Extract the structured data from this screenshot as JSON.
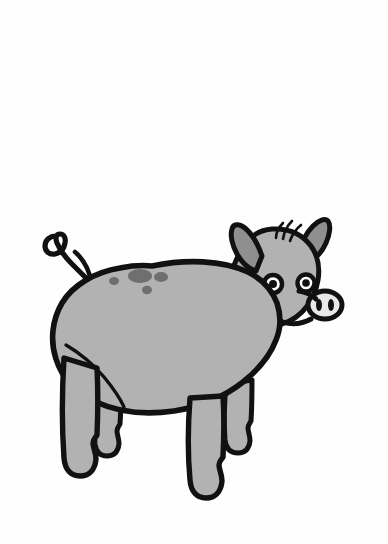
{
  "image": {
    "title": "Cartoon Pig",
    "subject": "pig",
    "style": "black-outline cartoon line drawing with flat gray fill",
    "orientation": "facing right, side profile (three-quarter head)",
    "width": 388,
    "height": 544
  },
  "colors": {
    "background": "#fefefe",
    "outline": "#111111",
    "body_fill": "#b2b2b2",
    "ear_inner_fill": "#8f8f8f",
    "spot_fill": "#6f6f6f",
    "eye_white": "#ffffff",
    "pupil": "#111111",
    "snout_fill": "#e8e8e8",
    "nostril": "#111111"
  },
  "parts": {
    "body": {
      "label": "body",
      "description": "large rounded oval torso",
      "center": [
        200,
        340
      ],
      "radius_x": 130,
      "radius_y": 92
    },
    "head": {
      "label": "head",
      "description": "head with snout, two eyes, two pointed ears, hair tuft",
      "center": [
        285,
        275
      ]
    },
    "snout": {
      "label": "snout",
      "description": "oval nose disc with two vertical nostrils",
      "center": [
        325,
        305
      ],
      "radius_x": 17,
      "radius_y": 14,
      "nostril_count": 2
    },
    "eyes": {
      "label": "eyes",
      "count": 2,
      "left_eye": [
        273,
        283
      ],
      "right_eye": [
        306,
        283
      ],
      "outer_radius": 9,
      "pupil_radius": 4
    },
    "ears": {
      "label": "ears",
      "count": 2,
      "near_ear_tip": [
        246,
        228
      ],
      "far_ear_tip": [
        314,
        228
      ],
      "shape": "pointed leaf"
    },
    "hair_tuft": {
      "label": "hair-tuft",
      "strand_count": 3,
      "position": [
        283,
        232
      ]
    },
    "mouth": {
      "label": "mouth",
      "description": "wavy line curving left from below the snout"
    },
    "tail": {
      "label": "tail",
      "description": "curly spiral tail on upper-left rear",
      "position": [
        72,
        262
      ]
    },
    "legs": {
      "label": "legs",
      "count": 4,
      "description": "four stubby legs with notched hooves",
      "hoof_notch": true,
      "positions": [
        {
          "name": "front-far-leg",
          "x": 236,
          "y": 455
        },
        {
          "name": "front-near-leg",
          "x": 207,
          "y": 480
        },
        {
          "name": "hind-far-leg",
          "x": 108,
          "y": 448
        },
        {
          "name": "hind-near-leg",
          "x": 80,
          "y": 470
        }
      ]
    },
    "back_spots": {
      "label": "back-spots",
      "count": 4,
      "items": [
        {
          "name": "spot-small-left",
          "cx": 114,
          "cy": 281,
          "rx": 5,
          "ry": 4
        },
        {
          "name": "spot-large-center",
          "cx": 140,
          "cy": 276,
          "rx": 12,
          "ry": 7
        },
        {
          "name": "spot-medium-right",
          "cx": 161,
          "cy": 277,
          "rx": 7,
          "ry": 5
        },
        {
          "name": "spot-small-lower",
          "cx": 147,
          "cy": 290,
          "rx": 5,
          "ry": 4
        }
      ]
    }
  }
}
